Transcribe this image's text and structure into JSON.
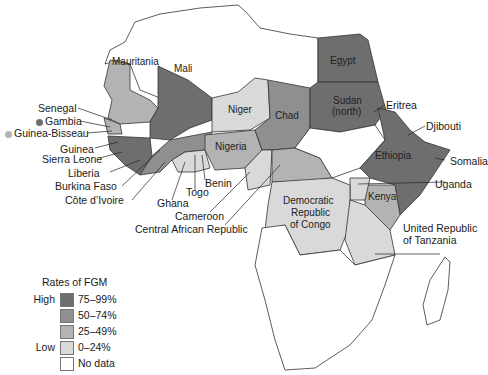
{
  "map": {
    "title": "Rates of FGM in Africa",
    "colors": {
      "r75_99": "#6e6e6e",
      "r50_74": "#8f8f8f",
      "r25_49": "#b3b3b3",
      "r0_24": "#d9d9d9",
      "no_data": "#ffffff",
      "border": "#333333"
    },
    "countries": [
      {
        "name": "Egypt",
        "rate": "75–99%"
      },
      {
        "name": "Sudan (north)",
        "rate": "75–99%"
      },
      {
        "name": "Eritrea",
        "rate": "75–99%"
      },
      {
        "name": "Djibouti",
        "rate": "75–99%"
      },
      {
        "name": "Ethiopia",
        "rate": "75–99%"
      },
      {
        "name": "Somalia",
        "rate": "75–99%"
      },
      {
        "name": "Mali",
        "rate": "75–99%"
      },
      {
        "name": "Guinea",
        "rate": "75–99%"
      },
      {
        "name": "Sierra Leone",
        "rate": "75–99%"
      },
      {
        "name": "Gambia",
        "rate": "75–99%"
      },
      {
        "name": "Burkina Faso",
        "rate": "50–74%"
      },
      {
        "name": "Chad",
        "rate": "25–49%"
      },
      {
        "name": "Mauritania",
        "rate": "25–49%"
      },
      {
        "name": "Côte d'Ivoire",
        "rate": "25–49%"
      },
      {
        "name": "Kenya",
        "rate": "25–49%"
      },
      {
        "name": "Guinea-Bisseau",
        "rate": "25–49%"
      },
      {
        "name": "Liberia",
        "rate": "50–74%"
      },
      {
        "name": "Nigeria",
        "rate": "25–49%"
      },
      {
        "name": "Central African Republic",
        "rate": "25–49%"
      },
      {
        "name": "Senegal",
        "rate": "25–49%"
      },
      {
        "name": "Niger",
        "rate": "0–24%"
      },
      {
        "name": "Ghana",
        "rate": "0–24%"
      },
      {
        "name": "Togo",
        "rate": "0–24%"
      },
      {
        "name": "Benin",
        "rate": "0–24%"
      },
      {
        "name": "Cameroon",
        "rate": "0–24%"
      },
      {
        "name": "Democratic Republic of Congo",
        "rate": "0–24%"
      },
      {
        "name": "Uganda",
        "rate": "0–24%"
      },
      {
        "name": "United Republic of Tanzania",
        "rate": "0–24%"
      }
    ],
    "inner_labels": {
      "mauritania": "Mauritania",
      "mali": "Mali",
      "niger": "Niger",
      "chad": "Chad",
      "egypt": "Egypt",
      "sudan_1": "Sudan",
      "sudan_2": "(north)",
      "nigeria": "Nigeria",
      "ethiopia": "Ethiopia",
      "kenya": "Kenya",
      "drc_1": "Democratic",
      "drc_2": "Republic",
      "drc_3": "of Congo"
    },
    "callouts": {
      "senegal": "Senegal",
      "gambia": "Gambia",
      "guinea_bisseau": "Guinea-Bisseau",
      "guinea": "Guinea",
      "sierra_leone": "Sierra Leone",
      "liberia": "Liberia",
      "burkina_faso": "Burkina Faso",
      "cote_divoire": "Côte d’Ivoire",
      "ghana": "Ghana",
      "togo": "Togo",
      "benin": "Benin",
      "cameroon": "Cameroon",
      "car": "Central African Republic",
      "eritrea": "Eritrea",
      "djibouti": "Djibouti",
      "somalia": "Somalia",
      "uganda": "Uganda",
      "tanzania_1": "United Republic",
      "tanzania_2": "of Tanzania"
    }
  },
  "legend": {
    "title": "Rates of FGM",
    "high_label": "High",
    "low_label": "Low",
    "items": [
      {
        "label": "75–99%",
        "color": "#6e6e6e"
      },
      {
        "label": "50–74%",
        "color": "#8f8f8f"
      },
      {
        "label": "25–49%",
        "color": "#b3b3b3"
      },
      {
        "label": "0–24%",
        "color": "#d9d9d9"
      },
      {
        "label": "No data",
        "color": "#ffffff"
      }
    ]
  }
}
